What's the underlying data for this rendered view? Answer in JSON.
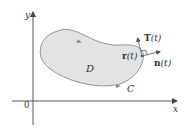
{
  "diagram": {
    "axes": {
      "x_label": "x",
      "y_label": "y",
      "origin_label": "0"
    },
    "region": {
      "label": "D",
      "fill": "#e3e3e3",
      "stroke": "#8a8a8a"
    },
    "curve": {
      "label": "C"
    },
    "vectors": {
      "position": {
        "letter": "r",
        "arg": "(t)"
      },
      "tangent": {
        "letter": "T",
        "arg": "(t)"
      },
      "normal": {
        "letter": "n",
        "arg": "(t)"
      }
    },
    "colors": {
      "axis": "#444444",
      "text": "#333333"
    }
  }
}
